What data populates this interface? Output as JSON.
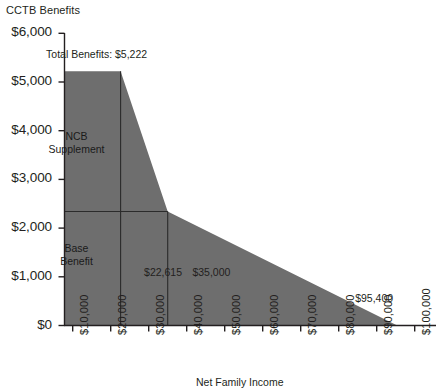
{
  "chart_data": {
    "type": "area",
    "title": "",
    "ylabel": "CCTB Benefits",
    "xlabel": "Net Family Income",
    "ylim": [
      0,
      6000
    ],
    "xlim": [
      0,
      105000
    ],
    "grid": false,
    "legend": "none",
    "ytick_labels": [
      "$6,000",
      "$5,000",
      "$4,000",
      "$3,000",
      "$2,000",
      "$1,000",
      "$0"
    ],
    "ytick_values": [
      6000,
      5000,
      4000,
      3000,
      2000,
      1000,
      0
    ],
    "xtick_labels": [
      "$10,000",
      "$20,000",
      "$30,000",
      "$40,000",
      "$50,000",
      "$60,000",
      "$70,000",
      "$80,000",
      "$90,000",
      "$100,000"
    ],
    "xtick_values": [
      10000,
      20000,
      30000,
      40000,
      50000,
      60000,
      70000,
      80000,
      90000,
      100000
    ],
    "series": [
      {
        "name": "Total CCTB Benefits",
        "points": [
          {
            "x": 0,
            "y": 5222
          },
          {
            "x": 22615,
            "y": 5222
          },
          {
            "x": 35000,
            "y": 2340
          },
          {
            "x": 95400,
            "y": 0
          },
          {
            "x": 0,
            "y": 0
          }
        ]
      }
    ],
    "internal_lines": [
      {
        "name": "base-benefit-level",
        "from": {
          "x": 0,
          "y": 2340
        },
        "to": {
          "x": 35000,
          "y": 2340
        }
      },
      {
        "name": "ncb-phaseout-start",
        "from": {
          "x": 22615,
          "y": 0
        },
        "to": {
          "x": 22615,
          "y": 5222
        }
      },
      {
        "name": "ncb-phaseout-end",
        "from": {
          "x": 35000,
          "y": 0
        },
        "to": {
          "x": 35000,
          "y": 2340
        }
      }
    ],
    "annotations": [
      {
        "name": "total-benefits",
        "text": "Total Benefits: $5,222",
        "x": 3000,
        "y": 5560
      },
      {
        "name": "ncb-supplement",
        "text": "NCB\nSupplement",
        "x": 11000,
        "y": 3750
      },
      {
        "name": "base-benefit",
        "text": "Base\nBenefit",
        "x": 11000,
        "y": 1450
      },
      {
        "name": "threshold-22615",
        "text": "$22,615",
        "x": 28800,
        "y": 1070
      },
      {
        "name": "threshold-35000",
        "text": "$35,000",
        "x": 41500,
        "y": 1070
      },
      {
        "name": "threshold-95400",
        "text": "$95,400",
        "x": 97500,
        "y": 540
      }
    ],
    "colors": {
      "area_fill": "#6e6e6e",
      "axis": "#231f20",
      "text": "#231f20"
    }
  }
}
